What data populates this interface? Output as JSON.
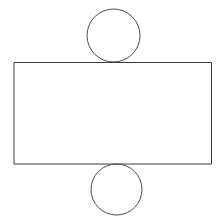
{
  "canvas": {
    "width": 222,
    "height": 224,
    "background_color": "#ffffff",
    "description": "Line drawing of a wide rectangle with one circle tangent above its top edge and one circle tangent below its bottom edge"
  },
  "style": {
    "stroke_color": "#4a4a4a",
    "stroke_color_dark": "#3c3c3c",
    "stroke_width": 1,
    "fill": "none"
  },
  "shapes": [
    {
      "name": "top-circle",
      "type": "circle",
      "cx": 113.5,
      "cy": 35.5,
      "r": 26.5,
      "stroke": "#4a4a4a",
      "stroke_width": 1,
      "fill": "none"
    },
    {
      "name": "main-rectangle",
      "type": "rect",
      "x": 14,
      "y": 62.5,
      "width": 197.5,
      "height": 101.5,
      "stroke": "#3c3c3c",
      "stroke_width": 1,
      "fill": "none"
    },
    {
      "name": "bottom-circle",
      "type": "circle",
      "cx": 116.5,
      "cy": 189.5,
      "r": 25.5,
      "stroke": "#4a4a4a",
      "stroke_width": 1,
      "fill": "none"
    }
  ]
}
